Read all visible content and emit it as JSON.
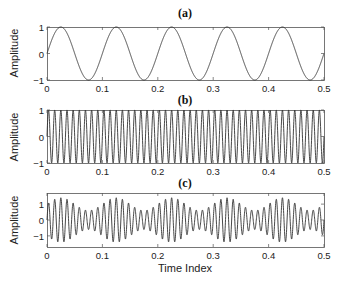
{
  "chart_data": [
    {
      "type": "line",
      "title": "(a)",
      "xlabel": "",
      "ylabel": "Amplitude",
      "xlim": [
        0,
        0.5
      ],
      "ylim": [
        -1,
        1
      ],
      "xticks": [
        0,
        0.1,
        0.2,
        0.3,
        0.4,
        0.5
      ],
      "xtick_labels": [
        "0",
        "0.1",
        "0.2",
        "0.3",
        "0.4",
        "0.5"
      ],
      "yticks": [
        -1,
        0,
        1
      ],
      "ytick_labels": [
        "−1",
        "0",
        "1"
      ],
      "grid": false,
      "series": [
        {
          "name": "sine 10 Hz",
          "formula": "sin(2*pi*10*t)",
          "frequency": 10,
          "amplitude": 1,
          "color": "#333333"
        }
      ],
      "box": {
        "left": 47,
        "top": 27,
        "right": 324,
        "bottom": 80
      }
    },
    {
      "type": "line",
      "title": "(b)",
      "xlabel": "",
      "ylabel": "Amplitude",
      "xlim": [
        0,
        0.5
      ],
      "ylim": [
        -1,
        1
      ],
      "xticks": [
        0,
        0.1,
        0.2,
        0.3,
        0.4,
        0.5
      ],
      "xtick_labels": [
        "0",
        "0.1",
        "0.2",
        "0.3",
        "0.4",
        "0.5"
      ],
      "yticks": [
        -1,
        0,
        1
      ],
      "ytick_labels": [
        "−1",
        "0",
        "1"
      ],
      "grid": false,
      "series": [
        {
          "name": "sine 90 Hz",
          "formula": "sin(2*pi*90*t)",
          "frequency": 90,
          "amplitude": 1,
          "color": "#333333"
        }
      ],
      "box": {
        "left": 47,
        "top": 110,
        "right": 324,
        "bottom": 163
      }
    },
    {
      "type": "line",
      "title": "(c)",
      "xlabel": "Time Index",
      "ylabel": "Amplitude",
      "xlim": [
        0,
        0.5
      ],
      "ylim": [
        -1.7,
        1.7
      ],
      "xticks": [
        0,
        0.1,
        0.2,
        0.3,
        0.4,
        0.5
      ],
      "xtick_labels": [
        "0",
        "0.1",
        "0.2",
        "0.3",
        "0.4",
        "0.5"
      ],
      "yticks": [
        -1,
        0,
        1
      ],
      "ytick_labels": [
        "−1",
        "0",
        "1"
      ],
      "grid": false,
      "series": [
        {
          "name": "amplitude-modulated signal",
          "formula": "(1+0.4*sin(2*pi*10*t))*sin(2*pi*90*t)",
          "carrier_frequency": 90,
          "modulation_frequency": 10,
          "modulation_depth": 0.4,
          "color": "#333333"
        }
      ],
      "box": {
        "left": 47,
        "top": 193,
        "right": 324,
        "bottom": 247
      }
    }
  ],
  "colors": {
    "axes": "#555555",
    "line": "#333333",
    "text": "#222222"
  }
}
